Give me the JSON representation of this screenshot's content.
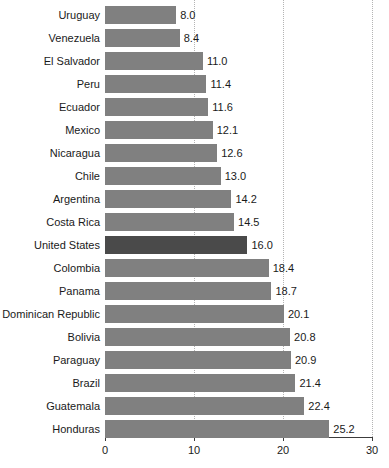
{
  "chart_data": {
    "type": "bar",
    "orientation": "horizontal",
    "title": "",
    "subtitle": "",
    "xlabel": "",
    "ylabel": "",
    "xlim": [
      0,
      30
    ],
    "xticks": [
      "0",
      "10",
      "20",
      "30"
    ],
    "grid": "vertical-dotted",
    "legend": "none",
    "highlight_category": "United States",
    "colors": {
      "bar": "#808080",
      "bar_highlight": "#4a4a4a",
      "gridline": "#b4b4b4",
      "axis": "#3c3c3c",
      "text": "#1a1a1a",
      "background": "#ffffff"
    },
    "categories": [
      "Uruguay",
      "Venezuela",
      "El Salvador",
      "Peru",
      "Ecuador",
      "Mexico",
      "Nicaragua",
      "Chile",
      "Argentina",
      "Costa Rica",
      "United States",
      "Colombia",
      "Panama",
      "Dominican Republic",
      "Bolivia",
      "Paraguay",
      "Brazil",
      "Guatemala",
      "Honduras"
    ],
    "values": [
      8.0,
      8.4,
      11.0,
      11.4,
      11.6,
      12.1,
      12.6,
      13.0,
      14.2,
      14.5,
      16.0,
      18.4,
      18.7,
      20.1,
      20.8,
      20.9,
      21.4,
      22.4,
      25.2
    ],
    "value_labels": [
      "8.0",
      "8.4",
      "11.0",
      "11.4",
      "11.6",
      "12.1",
      "12.6",
      "13.0",
      "14.2",
      "14.5",
      "16.0",
      "18.4",
      "18.7",
      "20.1",
      "20.8",
      "20.9",
      "21.4",
      "22.4",
      "25.2"
    ]
  }
}
